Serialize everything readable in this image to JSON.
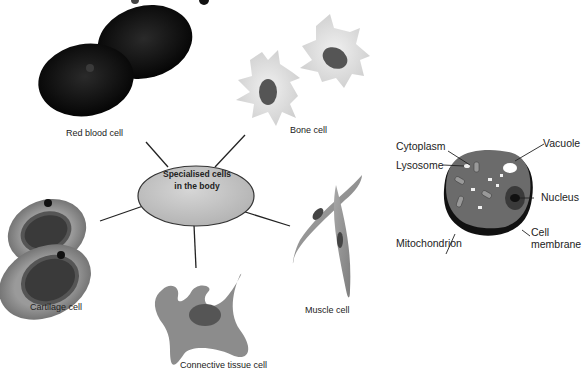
{
  "hub": {
    "line1": "Specialised cells",
    "line2": "in the body",
    "fill": "#c8c8c8"
  },
  "cells": {
    "red_blood": "Red blood cell",
    "bone": "Bone cell",
    "cartilage": "Cartilage cell",
    "connective": "Connective tissue cell",
    "muscle": "Muscle cell"
  },
  "generic_cell": {
    "labels": {
      "cytoplasm": "Cytoplasm",
      "lysosome": "Lysosome",
      "vacuole": "Vacuole",
      "nucleus": "Nucleus",
      "mitochondrion": "Mitochondrion",
      "cell_membrane_1": "Cell",
      "cell_membrane_2": "membrane"
    }
  },
  "colors": {
    "red_blood": "#0a0a0a",
    "bone": "#dcdcdc",
    "cartilage_outer": "#8a8a8a",
    "connective": "#8c8c8c",
    "muscle": "#9a9a9a",
    "generic_cytoplasm": "#6b6b6b",
    "generic_membrane": "#111111"
  }
}
